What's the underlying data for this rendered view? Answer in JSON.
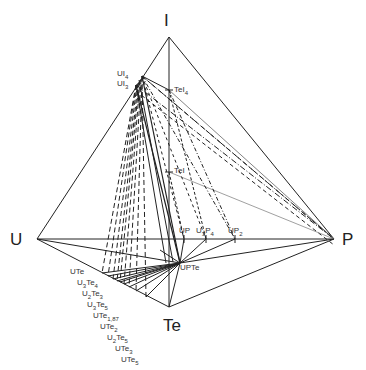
{
  "diagram": {
    "type": "quaternary phase diagram (tetrahedron projection)",
    "vertices": [
      {
        "id": "I",
        "label": "I",
        "x": 169,
        "y": 37
      },
      {
        "id": "U",
        "label": "U",
        "x": 37,
        "y": 239
      },
      {
        "id": "P",
        "label": "P",
        "x": 334,
        "y": 239
      },
      {
        "id": "Te",
        "label": "Te",
        "x": 169,
        "y": 307
      }
    ],
    "compounds": {
      "UI4": {
        "text": "UI",
        "sub": "4",
        "x": 142,
        "y": 76
      },
      "UI3": {
        "text": "UI",
        "sub": "3",
        "x": 136,
        "y": 85
      },
      "TeI4": {
        "text": "TeI",
        "sub": "4",
        "x": 169,
        "y": 90
      },
      "TeI": {
        "text": "TeI",
        "sub": "",
        "x": 169,
        "y": 172
      },
      "UP": {
        "text": "UP",
        "sub": "",
        "x": 184,
        "y": 239
      },
      "U3P4": {
        "text": "U",
        "sub": "3",
        "text2": "P",
        "sub2": "4",
        "x": 206,
        "y": 239
      },
      "UP2": {
        "text": "UP",
        "sub": "2",
        "x": 235,
        "y": 239
      },
      "UPTe": {
        "text": "UPTe",
        "sub": "",
        "x": 180,
        "y": 263
      }
    },
    "u_te_edge_compounds": [
      {
        "text": "UTe",
        "sub": "",
        "x": 102,
        "y": 273
      },
      {
        "text": "U",
        "sub": "3",
        "text2": "Te",
        "sub2": "4",
        "x": 113,
        "y": 279
      },
      {
        "text": "U",
        "sub": "2",
        "text2": "Te",
        "sub2": "3",
        "x": 118,
        "y": 282
      },
      {
        "text": "U",
        "sub": "3",
        "text2": "Te",
        "sub2": "5",
        "x": 122,
        "y": 284
      },
      {
        "text": "UTe",
        "sub": "1,87",
        "x": 125,
        "y": 285
      },
      {
        "text": "UTe",
        "sub": "2",
        "x": 129,
        "y": 288
      },
      {
        "text": "U",
        "sub": "2",
        "text2": "Te",
        "sub2": "5",
        "x": 133,
        "y": 290
      },
      {
        "text": "UTe",
        "sub": "3",
        "x": 139,
        "y": 293
      },
      {
        "text": "UTe",
        "sub": "5",
        "x": 146,
        "y": 297
      }
    ],
    "line_styles": {
      "edge": "solid",
      "tie_line_UI3_UTe_series": "dashed",
      "tie_line_UI4_P": "dash-dot",
      "tie_line_TeI_P": "dotted-thin"
    }
  }
}
